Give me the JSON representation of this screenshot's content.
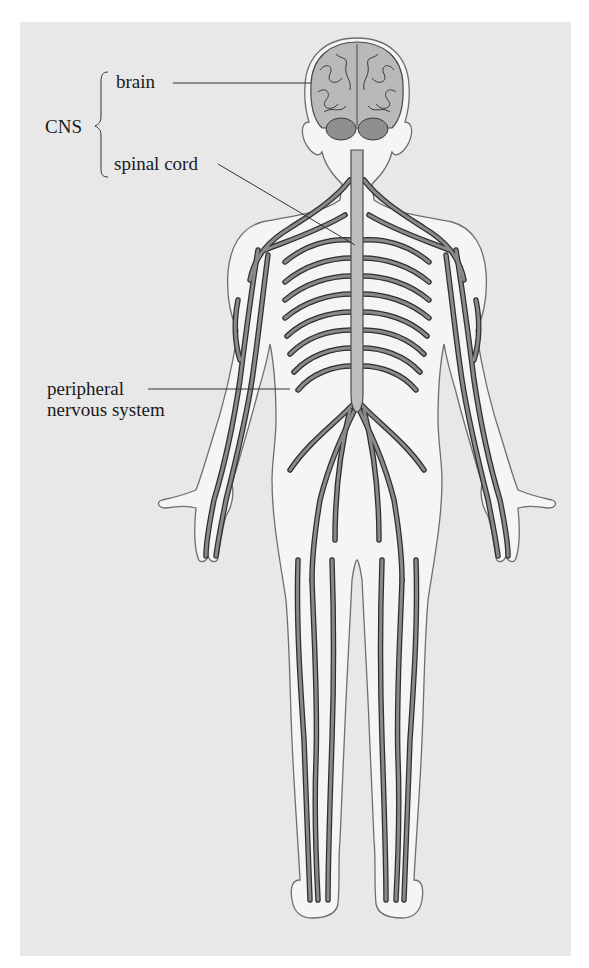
{
  "diagram": {
    "type": "anatomical-labeled-diagram",
    "labels": {
      "group_cns": "CNS",
      "brain": "brain",
      "spinal_cord": "spinal cord",
      "pns_line1": "peripheral",
      "pns_line2": "nervous system"
    },
    "structure": {
      "CNS": [
        "brain",
        "spinal cord"
      ],
      "other": [
        "peripheral nervous system"
      ]
    },
    "colors": {
      "outer_background": "#ffffff",
      "panel_background": "#e8e8e8",
      "body_fill": "#f5f5f5",
      "body_outline": "#6e6e6e",
      "nerve_fill": "#8a8a8a",
      "nerve_outline": "#2e2e2e",
      "spinal_cord_fill": "#bdbdbd",
      "brain_fill": "#b9b9b9",
      "cerebellum_fill": "#8f8f8f",
      "leader_line": "#333333",
      "text": "#1a1a1a"
    }
  }
}
